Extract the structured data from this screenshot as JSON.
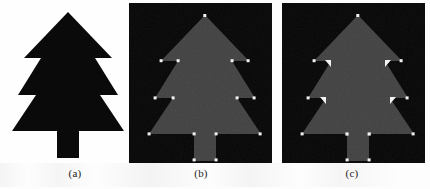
{
  "figure": {
    "background_color": "#fdfdfd",
    "panels": [
      {
        "id": "a",
        "caption": "(a)",
        "description": "Original binary tree silhouette, black shape on white background",
        "background_color": "#fefefe",
        "shape_fill": "#0a0a0a",
        "markers": []
      },
      {
        "id": "b",
        "caption": "(b)",
        "description": "Tree silhouette in dark gray on black background with small white dot markers at all detected corner points",
        "background_color": "#060606",
        "shape_fill": "#414141",
        "marker_color": "#f2f2f2",
        "marker_style": "small-dot",
        "marker_count": 13
      },
      {
        "id": "c",
        "caption": "(c)",
        "description": "Tree silhouette in dark gray on black background with small dots at convex corners and larger white triangular markers at the concave corners",
        "background_color": "#060606",
        "shape_fill": "#414141",
        "marker_color": "#f2f2f2",
        "marker_style": "mixed-dot-and-wedge",
        "marker_count": 13
      }
    ],
    "shape": {
      "name": "tree",
      "outline_points": "68,12 112,58 95,58 118,95 100,95 124,131 79,131 79,158 57,158 57,131 12,131 36,95 18,95 41,58 24,58",
      "corner_points_convex": [
        {
          "name": "top-apex",
          "x": 68,
          "y": 12
        },
        {
          "name": "tier1-right-base",
          "x": 112,
          "y": 58
        },
        {
          "name": "tier2-right-base",
          "x": 118,
          "y": 95
        },
        {
          "name": "tier3-right-base",
          "x": 124,
          "y": 131
        },
        {
          "name": "trunk-right-bottom",
          "x": 79,
          "y": 158
        },
        {
          "name": "trunk-left-bottom",
          "x": 57,
          "y": 158
        },
        {
          "name": "tier3-left-base",
          "x": 12,
          "y": 131
        },
        {
          "name": "tier2-left-base",
          "x": 18,
          "y": 95
        },
        {
          "name": "tier1-left-base",
          "x": 24,
          "y": 58
        }
      ],
      "corner_points_concave": [
        {
          "name": "tier1-right-notch",
          "x": 95,
          "y": 58
        },
        {
          "name": "tier2-right-notch",
          "x": 100,
          "y": 95
        },
        {
          "name": "trunk-right-shoulder",
          "x": 79,
          "y": 131
        },
        {
          "name": "trunk-left-shoulder",
          "x": 57,
          "y": 131
        },
        {
          "name": "tier2-left-notch",
          "x": 36,
          "y": 95
        },
        {
          "name": "tier1-left-notch",
          "x": 41,
          "y": 58
        }
      ]
    },
    "colors": {
      "page": "#fdfdfd",
      "panel_black": "#060606",
      "shape_black": "#0a0a0a",
      "shape_gray": "#414141",
      "marker_white": "#f2f2f2",
      "caption_text": "#1b1b1b"
    }
  }
}
